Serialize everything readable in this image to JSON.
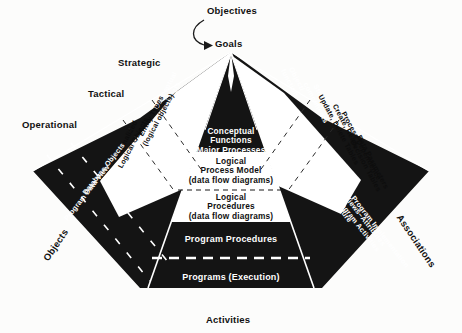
{
  "figure": {
    "title": "Objectives",
    "apex_label": "Goals",
    "bottom_label": "Activities",
    "left_edge_label": "Objects",
    "right_edge_label": "Associations",
    "colors": {
      "background": "#fcfcfb",
      "fill_dark": "#141414",
      "fill_light": "#ffffff",
      "text_on_dark": "#ffffff",
      "text_on_light": "#101010"
    }
  },
  "levels": {
    "strategic": "Strategic",
    "tactical": "Tactical",
    "operational": "Operational"
  },
  "center_triangle": {
    "rows": [
      {
        "id": "conceptual-functions",
        "tone": "dark",
        "lines": [
          "Conceptual",
          "Functions",
          "Major Processes"
        ]
      },
      {
        "id": "logical-process-model",
        "tone": "light",
        "lines": [
          "Logical",
          "Process Model",
          "(data flow diagrams)"
        ]
      },
      {
        "id": "logical-procedures",
        "tone": "light",
        "lines": [
          "Logical",
          "Procedures",
          "(data flow diagrams)"
        ]
      },
      {
        "id": "program-procedures",
        "tone": "dark",
        "lines": [
          "Program Procedures"
        ]
      },
      {
        "id": "programs-execution",
        "tone": "dark",
        "lines": [
          "Programs (Execution)"
        ]
      }
    ]
  },
  "left_wing": {
    "dark_upper": [
      {
        "id": "conceptual-objects",
        "lines": [
          "Conceptual",
          "objects",
          "(entity",
          "relationship",
          "diagrams)"
        ]
      }
    ],
    "light_band": [
      {
        "id": "entity-types",
        "lines": [
          "Entity Types",
          "(logical objects)"
        ]
      },
      {
        "id": "normalized-logical-objects",
        "lines": [
          "Normalized",
          "Logical Objects"
        ]
      }
    ],
    "dark_lower": [
      {
        "id": "database-objects",
        "lines": [
          "Database Objects"
        ]
      },
      {
        "id": "program-data-view",
        "lines": [
          "Program Data View"
        ]
      }
    ]
  },
  "right_wing": {
    "dark_upper": [
      {
        "id": "object-function",
        "lines": [
          "Object/",
          "function"
        ]
      },
      {
        "id": "strategic-components",
        "lines": [
          "Strategic",
          "components"
        ]
      }
    ],
    "light_band": [
      {
        "id": "crud-tables",
        "lines": [
          "Create, Read,",
          "Update, Delete Tables"
        ]
      },
      {
        "id": "process-dependence",
        "lines": [
          "Process Dependence"
        ]
      },
      {
        "id": "data-parameters",
        "lines": [
          "Data Parameters",
          "Decision Tables"
        ]
      }
    ],
    "dark_lower": [
      {
        "id": "object-procedure",
        "lines": [
          "Object–Procedure"
        ]
      },
      {
        "id": "user-views-attributes",
        "lines": [
          "User Views–Attributes",
          "and Program Activities"
        ]
      },
      {
        "id": "program-implementation",
        "lines": [
          "Program Implementation"
        ]
      }
    ]
  }
}
